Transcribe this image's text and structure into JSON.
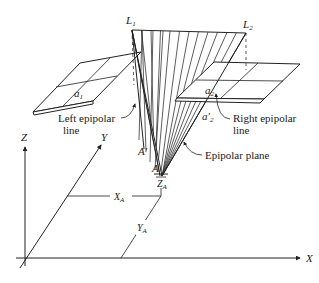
{
  "figure": {
    "labels": {
      "L1": "L",
      "L1_sub": "1",
      "L2": "L",
      "L2_sub": "2",
      "a1": "a",
      "a1_sub": "1",
      "a2": "a",
      "a2_sub": "2",
      "a2_prime": "a′",
      "a2_prime_sub": "2",
      "A_prime": "A′",
      "A": "A",
      "ZA": "Z",
      "ZA_sub": "A",
      "XA": "X",
      "XA_sub": "A",
      "YA": "Y",
      "YA_sub": "A",
      "axis_X": "X",
      "axis_Y": "Y",
      "axis_Z": "Z"
    },
    "callouts": {
      "left_epipolar_line_1": "Left epipolar",
      "left_epipolar_line_2": "line",
      "right_epipolar_line_1": "Right epipolar",
      "right_epipolar_line_2": "line",
      "epipolar_plane": "Epipolar plane"
    }
  }
}
